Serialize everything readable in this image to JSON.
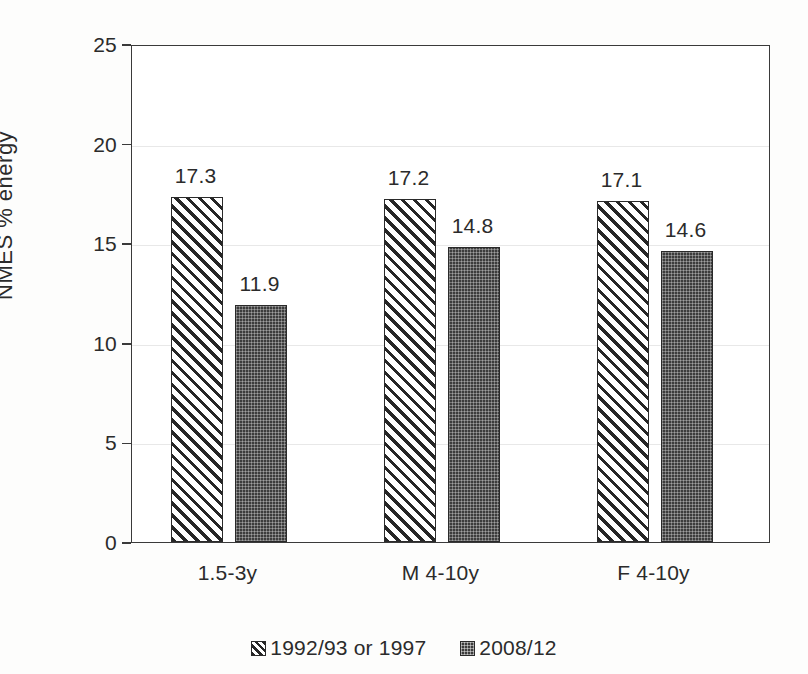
{
  "chart_data": {
    "type": "bar",
    "title": "",
    "xlabel": "",
    "ylabel": "NMES % energy",
    "ylim": [
      0,
      25
    ],
    "yticks": [
      0,
      5,
      10,
      15,
      20,
      25
    ],
    "ytick_labels": [
      "0",
      "5",
      "10",
      "15",
      "20",
      "25"
    ],
    "grid": true,
    "legend_position": "bottom-center",
    "categories": [
      "1.5-3y",
      "M 4-10y",
      "F 4-10y"
    ],
    "series": [
      {
        "name": "1992/93 or 1997",
        "values": [
          17.3,
          17.2,
          17.1
        ],
        "value_labels": [
          "17.3",
          "17.2",
          "17.1"
        ],
        "style": "diagonal-hatch",
        "color": "#262626"
      },
      {
        "name": "2008/12",
        "values": [
          11.9,
          14.8,
          14.6
        ],
        "value_labels": [
          "11.9",
          "14.8",
          "14.6"
        ],
        "style": "dark-dotted",
        "color": "#3c3c3c"
      }
    ]
  },
  "legend": {
    "entries": [
      {
        "label": "1992/93 or 1997"
      },
      {
        "label": "2008/12"
      }
    ]
  }
}
